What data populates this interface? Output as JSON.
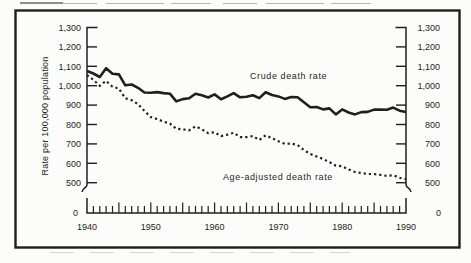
{
  "colors": {
    "ink": "#1f1f1f",
    "paper": "#fcfcfa",
    "artifact_dark": "#6a6a6a",
    "artifact_light": "#b5b5b5",
    "noise": "#d6d4d0"
  },
  "chart_data": {
    "type": "line",
    "ylabel": "Rate per 100,000 population",
    "xlabel": "",
    "grid": false,
    "legend": "none (inline annotations)",
    "x_range": [
      1940,
      1990
    ],
    "x_tick_labels": [
      "1940",
      "1950",
      "1960",
      "1970",
      "1980",
      "1990"
    ],
    "y_tick_values_upper": [
      1300,
      1200,
      1100,
      1000,
      900,
      800,
      700,
      600,
      500
    ],
    "y_tick_labels_upper": [
      "1,300",
      "1,200",
      "1,100",
      "1,000",
      "900",
      "800",
      "700",
      "600",
      "500"
    ],
    "y_zero_label": "0",
    "axis_break_between": [
      0,
      500
    ],
    "years": [
      1940,
      1941,
      1942,
      1943,
      1944,
      1945,
      1946,
      1947,
      1948,
      1949,
      1950,
      1951,
      1952,
      1953,
      1954,
      1955,
      1956,
      1957,
      1958,
      1959,
      1960,
      1961,
      1962,
      1963,
      1964,
      1965,
      1966,
      1967,
      1968,
      1969,
      1970,
      1971,
      1972,
      1973,
      1974,
      1975,
      1976,
      1977,
      1978,
      1979,
      1980,
      1981,
      1982,
      1983,
      1984,
      1985,
      1986,
      1987,
      1988,
      1989,
      1990
    ],
    "series": [
      {
        "name": "Crude death rate",
        "style": "solid",
        "values": [
          1076,
          1063,
          1045,
          1090,
          1062,
          1058,
          1002,
          1006,
          989,
          965,
          964,
          967,
          962,
          959,
          919,
          931,
          935,
          958,
          951,
          939,
          955,
          930,
          945,
          962,
          940,
          943,
          951,
          936,
          966,
          952,
          945,
          932,
          942,
          940,
          915,
          889,
          890,
          878,
          883,
          852,
          878,
          862,
          852,
          864,
          865,
          877,
          877,
          876,
          887,
          871,
          864
        ]
      },
      {
        "name": "Age-adjusted death rate",
        "style": "dotted",
        "values": [
          1055,
          1030,
          1000,
          1025,
          995,
          985,
          935,
          925,
          905,
          870,
          838,
          828,
          815,
          805,
          778,
          775,
          770,
          790,
          775,
          755,
          760,
          740,
          748,
          757,
          735,
          735,
          740,
          720,
          744,
          730,
          714,
          700,
          702,
          695,
          668,
          648,
          635,
          622,
          606,
          588,
          585,
          568,
          555,
          550,
          545,
          545,
          540,
          535,
          538,
          525,
          518
        ]
      }
    ],
    "annotations": [
      {
        "text": "Crude death rate",
        "px": [
          250,
          70
        ]
      },
      {
        "text": "Age-adjusted death rate",
        "px": [
          223,
          171
        ]
      }
    ]
  }
}
